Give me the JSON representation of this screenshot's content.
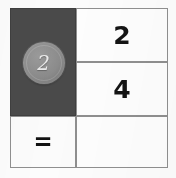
{
  "worksheet": {
    "type": "math-equation-grid",
    "columns": 2,
    "rows": 3,
    "token_cell": {
      "icon_name": "counter-token-circle",
      "token_value": "2",
      "background_color": "#4a4a4a",
      "token_color": "#8b8b8b",
      "token_text_color": "#e9e9e9"
    },
    "operand_cells": [
      {
        "value": "2"
      },
      {
        "value": "4"
      }
    ],
    "equals_cell": {
      "symbol": "=",
      "symbol_name": "equals-sign"
    },
    "answer_cell": {
      "value": "",
      "placeholder": ""
    },
    "colors": {
      "grid_border": "#8f8f8f",
      "cell_background": "#fdfdfd",
      "page_background": "#fcfcfc",
      "numeral_color": "#141414"
    }
  }
}
